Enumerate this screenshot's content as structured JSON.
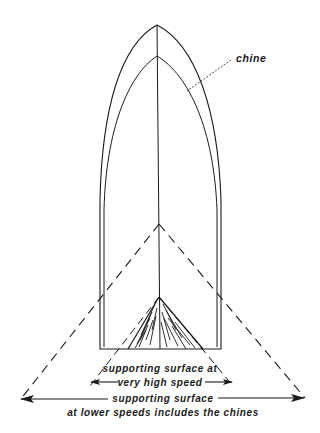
{
  "diagram": {
    "labels": {
      "chine": "chine",
      "high_speed_line1": "supporting surface at",
      "high_speed_line2": "very high speed",
      "low_speed_line1": "supporting surface",
      "low_speed_line2": "at lower speeds includes the chines"
    },
    "colors": {
      "stroke": "#1a1a1a",
      "background": "#ffffff"
    }
  }
}
